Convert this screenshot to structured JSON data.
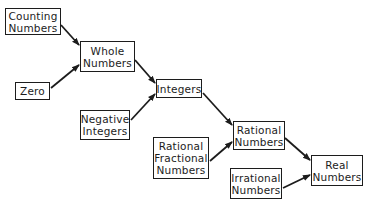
{
  "diagram": {
    "type": "flow-hierarchy",
    "title": "",
    "nodes": [
      {
        "id": "counting",
        "lines": [
          "Counting",
          "Numbers"
        ],
        "box": [
          5,
          8,
          56,
          27
        ]
      },
      {
        "id": "whole",
        "lines": [
          "Whole",
          "Numbers"
        ],
        "box": [
          80,
          41,
          55,
          31
        ]
      },
      {
        "id": "zero",
        "lines": [
          "Zero"
        ],
        "box": [
          15,
          82,
          35,
          18
        ]
      },
      {
        "id": "integers",
        "lines": [
          "Integers"
        ],
        "box": [
          156,
          79,
          46,
          19
        ]
      },
      {
        "id": "negative",
        "lines": [
          "Negative",
          "Integers"
        ],
        "box": [
          80,
          110,
          50,
          30
        ]
      },
      {
        "id": "rational_fractional",
        "lines": [
          "Rational",
          "Fractional",
          "Numbers"
        ],
        "box": [
          153,
          137,
          56,
          42
        ]
      },
      {
        "id": "rational",
        "lines": [
          "Rational",
          "Numbers"
        ],
        "box": [
          233,
          121,
          52,
          29
        ]
      },
      {
        "id": "irrational",
        "lines": [
          "Irrational",
          "Numbers"
        ],
        "box": [
          230,
          168,
          52,
          31
        ]
      },
      {
        "id": "real",
        "lines": [
          "Real",
          "Numbers"
        ],
        "box": [
          311,
          155,
          52,
          31
        ]
      }
    ],
    "edges": [
      {
        "from": "counting",
        "to": "whole",
        "x1": 61,
        "y1": 25,
        "x2": 79,
        "y2": 45
      },
      {
        "from": "zero",
        "to": "whole",
        "x1": 51,
        "y1": 88,
        "x2": 79,
        "y2": 65
      },
      {
        "from": "whole",
        "to": "integers",
        "x1": 135,
        "y1": 60,
        "x2": 155,
        "y2": 83
      },
      {
        "from": "negative",
        "to": "integers",
        "x1": 131,
        "y1": 120,
        "x2": 155,
        "y2": 94
      },
      {
        "from": "integers",
        "to": "rational",
        "x1": 203,
        "y1": 93,
        "x2": 232,
        "y2": 125
      },
      {
        "from": "rational_fractional",
        "to": "rational",
        "x1": 210,
        "y1": 161,
        "x2": 232,
        "y2": 142
      },
      {
        "from": "rational",
        "to": "real",
        "x1": 285,
        "y1": 138,
        "x2": 310,
        "y2": 160
      },
      {
        "from": "irrational",
        "to": "real",
        "x1": 283,
        "y1": 188,
        "x2": 310,
        "y2": 175
      }
    ],
    "colors": {
      "stroke": "#1c1c1c",
      "background": "#ffffff",
      "text": "#1c1c1c"
    }
  }
}
